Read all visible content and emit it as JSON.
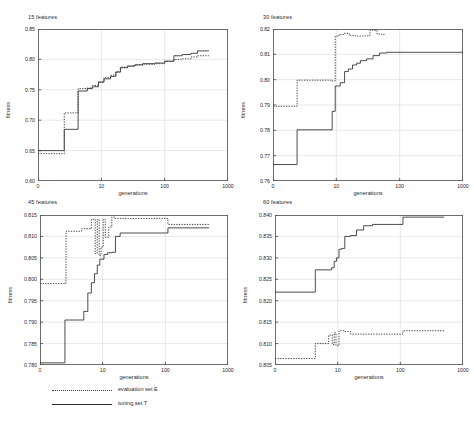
{
  "figure": {
    "background": "#ffffff",
    "legend": {
      "items": [
        {
          "label": "evaluation set E",
          "style": "dotted",
          "color": "#3a3a3a"
        },
        {
          "label": "tuning set T",
          "style": "solid",
          "color": "#2d2d2d"
        }
      ]
    }
  },
  "chart_data": [
    {
      "type": "line",
      "title": "15 features",
      "xlabel": "generations",
      "ylabel": "fitness",
      "xscale": "log",
      "xlim": [
        1,
        1000
      ],
      "xticks": [
        1,
        10,
        100,
        1000
      ],
      "xticklabels": [
        "0",
        "10",
        "100",
        "1000"
      ],
      "ylim": [
        0.6,
        0.85
      ],
      "yticks": [
        0.6,
        0.65,
        0.7,
        0.75,
        0.8,
        0.85
      ],
      "yticklabels": [
        "0.60",
        "0.65",
        "0.70",
        "0.75",
        "0.80",
        "0.85"
      ],
      "grid": true,
      "series": [
        {
          "name": "tuning set T",
          "style": "solid",
          "x": [
            1,
            2.6,
            2.6,
            4.3,
            4.3,
            6.0,
            6.0,
            7.2,
            7.2,
            9.0,
            9.0,
            11,
            11,
            14,
            14,
            17,
            17,
            20,
            20,
            26,
            26,
            34,
            34,
            45,
            45,
            70,
            70,
            100,
            100,
            140,
            140,
            190,
            190,
            260,
            260,
            330,
            330,
            500
          ],
          "y": [
            0.65,
            0.65,
            0.685,
            0.685,
            0.748,
            0.748,
            0.752,
            0.752,
            0.755,
            0.755,
            0.763,
            0.763,
            0.768,
            0.768,
            0.772,
            0.772,
            0.779,
            0.779,
            0.787,
            0.787,
            0.789,
            0.789,
            0.791,
            0.791,
            0.793,
            0.793,
            0.794,
            0.794,
            0.797,
            0.797,
            0.806,
            0.806,
            0.808,
            0.808,
            0.81,
            0.81,
            0.814,
            0.814
          ]
        },
        {
          "name": "evaluation set E",
          "style": "dotted",
          "x": [
            1,
            2.6,
            2.6,
            4.3,
            4.3,
            6.0,
            6.0,
            7.2,
            7.2,
            9.0,
            9.0,
            11,
            11,
            14,
            14,
            17,
            17,
            20,
            20,
            26,
            26,
            34,
            34,
            45,
            45,
            70,
            70,
            100,
            100,
            140,
            140,
            190,
            190,
            260,
            260,
            330,
            330,
            500
          ],
          "y": [
            0.645,
            0.645,
            0.712,
            0.712,
            0.752,
            0.752,
            0.753,
            0.753,
            0.757,
            0.757,
            0.762,
            0.762,
            0.77,
            0.77,
            0.774,
            0.774,
            0.78,
            0.78,
            0.786,
            0.786,
            0.789,
            0.789,
            0.791,
            0.791,
            0.792,
            0.792,
            0.793,
            0.793,
            0.797,
            0.797,
            0.8,
            0.8,
            0.801,
            0.801,
            0.804,
            0.804,
            0.806,
            0.806
          ]
        }
      ]
    },
    {
      "type": "line",
      "title": "30 features",
      "xlabel": "generations",
      "ylabel": "fitness",
      "xscale": "log",
      "xlim": [
        1,
        1000
      ],
      "xticks": [
        1,
        10,
        100,
        1000
      ],
      "xticklabels": [
        "0",
        "10",
        "100",
        "1000"
      ],
      "ylim": [
        0.76,
        0.82
      ],
      "yticks": [
        0.76,
        0.77,
        0.78,
        0.79,
        0.8,
        0.81,
        0.82
      ],
      "yticklabels": [
        "0.76",
        "0.77",
        "0.78",
        "0.79",
        "0.80",
        "0.81",
        "0.82"
      ],
      "grid": true,
      "series": [
        {
          "name": "tuning set T",
          "style": "solid",
          "x": [
            1,
            2.4,
            2.4,
            8.6,
            8.6,
            9.6,
            9.6,
            11.5,
            11.5,
            13.5,
            13.5,
            15.5,
            15.5,
            18,
            18,
            21,
            21,
            24,
            24,
            30,
            30,
            38,
            38,
            48,
            48,
            62,
            62,
            1000
          ],
          "y": [
            0.7665,
            0.7665,
            0.7802,
            0.7802,
            0.7875,
            0.7875,
            0.7975,
            0.7975,
            0.7988,
            0.7988,
            0.8032,
            0.8032,
            0.8042,
            0.8042,
            0.8058,
            0.8058,
            0.8065,
            0.8065,
            0.8075,
            0.8075,
            0.8082,
            0.8082,
            0.8095,
            0.8095,
            0.8105,
            0.8105,
            0.8108,
            0.8108
          ]
        },
        {
          "name": "evaluation set E",
          "style": "dotted",
          "x": [
            1,
            2.4,
            2.4,
            8.6,
            8.6,
            9.6,
            9.6,
            11.0,
            11.0,
            13,
            13,
            16,
            16,
            20,
            20,
            26,
            26,
            34,
            34,
            44,
            44,
            52,
            52,
            60,
            60,
            500
          ],
          "y": [
            0.7895,
            0.7895,
            0.7998,
            0.7998,
            0.7995,
            0.7995,
            0.8172,
            0.8172,
            0.8178,
            0.8178,
            0.8183,
            0.8183,
            0.8175,
            0.8175,
            0.8172,
            0.8172,
            0.8173,
            0.8173,
            0.8195,
            0.8195,
            0.818,
            0.818,
            0.8178,
            0.8178
          ]
        }
      ]
    },
    {
      "type": "line",
      "title": "45 features",
      "xlabel": "generations",
      "ylabel": "fitness",
      "xscale": "log",
      "xlim": [
        1,
        1000
      ],
      "xticks": [
        1,
        10,
        100,
        1000
      ],
      "xticklabels": [
        "0",
        "10",
        "100",
        "1000"
      ],
      "ylim": [
        0.78,
        0.815
      ],
      "yticks": [
        0.78,
        0.785,
        0.79,
        0.795,
        0.8,
        0.805,
        0.81,
        0.815
      ],
      "yticklabels": [
        "0.780",
        "0.785",
        "0.790",
        "0.795",
        "0.800",
        "0.805",
        "0.810",
        "0.815"
      ],
      "grid": true,
      "series": [
        {
          "name": "tuning set T",
          "style": "solid",
          "x": [
            1,
            2.5,
            2.5,
            5.0,
            5.0,
            5.8,
            5.8,
            6.6,
            6.6,
            7.4,
            7.4,
            8.2,
            8.2,
            9.0,
            9.0,
            10.5,
            10.5,
            12,
            12,
            14,
            14,
            16,
            16,
            19,
            19,
            110,
            110,
            500
          ],
          "y": [
            0.7805,
            0.7805,
            0.7905,
            0.7905,
            0.7925,
            0.7925,
            0.7968,
            0.7968,
            0.7992,
            0.7992,
            0.8013,
            0.8013,
            0.8033,
            0.8033,
            0.8047,
            0.8047,
            0.8058,
            0.8058,
            0.8062,
            0.8062,
            0.8063,
            0.8063,
            0.81,
            0.81,
            0.8108,
            0.8108,
            0.812,
            0.812
          ]
        },
        {
          "name": "evaluation set E",
          "style": "dotted",
          "x": [
            1,
            2.6,
            2.6,
            4.6,
            4.6,
            6.6,
            6.6,
            7.6,
            7.6,
            8.2,
            8.2,
            8.8,
            8.8,
            9.4,
            9.4,
            10.2,
            10.2,
            11.0,
            11.0,
            12.5,
            12.5,
            14.0,
            14.0,
            15.5,
            15.5,
            110,
            110,
            500
          ],
          "y": [
            0.799,
            0.799,
            0.8112,
            0.8112,
            0.8118,
            0.8118,
            0.814,
            0.814,
            0.806,
            0.806,
            0.814,
            0.814,
            0.8055,
            0.8055,
            0.8075,
            0.8075,
            0.814,
            0.814,
            0.8098,
            0.8098,
            0.8122,
            0.8122,
            0.8145,
            0.8145,
            0.8142,
            0.8142,
            0.8128,
            0.8128
          ]
        }
      ]
    },
    {
      "type": "line",
      "title": "60 features",
      "xlabel": "generations",
      "ylabel": "fitness",
      "xscale": "log",
      "xlim": [
        1,
        1000
      ],
      "xticks": [
        1,
        10,
        100,
        1000
      ],
      "xticklabels": [
        "0",
        "10",
        "100",
        "1000"
      ],
      "ylim": [
        0.805,
        0.84
      ],
      "yticks": [
        0.805,
        0.81,
        0.815,
        0.82,
        0.825,
        0.83,
        0.835,
        0.84
      ],
      "yticklabels": [
        "0.805",
        "0.810",
        "0.815",
        "0.820",
        "0.825",
        "0.830",
        "0.835",
        "0.840"
      ],
      "grid": true,
      "series": [
        {
          "name": "tuning set T",
          "style": "solid",
          "x": [
            1,
            4.4,
            4.4,
            8.0,
            8.0,
            8.8,
            8.8,
            9.6,
            9.6,
            10.5,
            10.5,
            11.5,
            11.5,
            13,
            13,
            16,
            16,
            20,
            20,
            26,
            26,
            36,
            36,
            110,
            110,
            500
          ],
          "y": [
            0.822,
            0.822,
            0.8272,
            0.8272,
            0.8277,
            0.8277,
            0.8292,
            0.8292,
            0.83,
            0.83,
            0.832,
            0.832,
            0.8322,
            0.8322,
            0.835,
            0.835,
            0.8352,
            0.8352,
            0.8365,
            0.8365,
            0.8375,
            0.8375,
            0.8378,
            0.8378,
            0.8395,
            0.8395
          ]
        },
        {
          "name": "evaluation set E",
          "style": "dotted",
          "x": [
            1,
            4.4,
            4.4,
            7.2,
            7.2,
            8.2,
            8.2,
            8.8,
            8.8,
            9.4,
            9.4,
            10.5,
            10.5,
            13,
            13,
            16,
            16,
            110,
            110,
            500
          ],
          "y": [
            0.8065,
            0.8065,
            0.81,
            0.81,
            0.812,
            0.812,
            0.8098,
            0.8098,
            0.8125,
            0.8125,
            0.8095,
            0.8095,
            0.813,
            0.813,
            0.8128,
            0.8128,
            0.8122,
            0.8122,
            0.813,
            0.813
          ]
        }
      ]
    }
  ]
}
